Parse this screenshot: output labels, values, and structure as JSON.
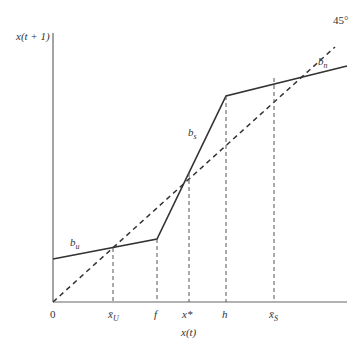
{
  "diagram": {
    "y_axis_label": "x(t + 1)",
    "x_axis_label": "x(t)",
    "diagonal_label": "45°",
    "origin_label": "0",
    "segments": {
      "lower": "b",
      "lower_sub": "u",
      "middle": "b",
      "middle_sub": "s",
      "upper": "b",
      "upper_sub": "n"
    },
    "ticks": [
      {
        "base": "x̄",
        "sub": "U"
      },
      {
        "base": "f",
        "sub": ""
      },
      {
        "base": "x*",
        "sub": ""
      },
      {
        "base": "h",
        "sub": ""
      },
      {
        "base": "x̄",
        "sub": "S"
      }
    ]
  },
  "colors": {
    "line": "#333333",
    "axis": "#555555"
  }
}
